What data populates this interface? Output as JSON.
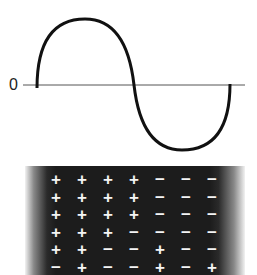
{
  "diagram": {
    "axis_label": "0",
    "wave": {
      "type": "sine",
      "cycles": 1,
      "start_x": 37,
      "end_x": 230,
      "axis_y": 85,
      "peak_y": 19,
      "trough_y": 150
    },
    "charge_grid": {
      "rows": [
        [
          "+",
          "+",
          "+",
          "+",
          "−",
          "−",
          "−"
        ],
        [
          "+",
          "+",
          "+",
          "+",
          "−",
          "−",
          "−"
        ],
        [
          "+",
          "+",
          "+",
          "+",
          "−",
          "−",
          "−"
        ],
        [
          "+",
          "+",
          "+",
          "−",
          "−",
          "−",
          "−"
        ],
        [
          "+",
          "+",
          "−",
          "−",
          "+",
          "−",
          "−"
        ],
        [
          "−",
          "+",
          "−",
          "−",
          "+",
          "−",
          "+"
        ]
      ]
    }
  }
}
